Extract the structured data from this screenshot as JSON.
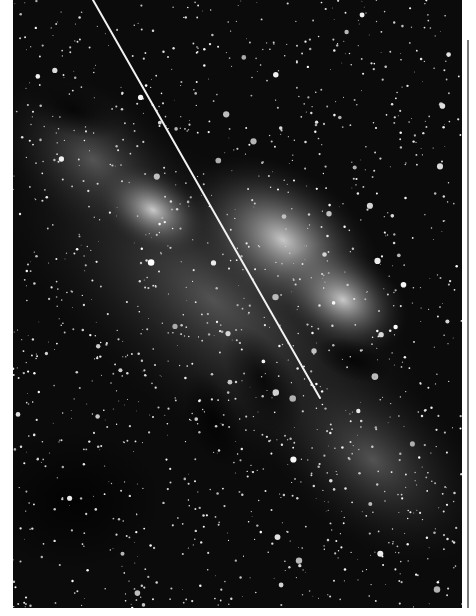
{
  "image": {
    "subject": "Milky Way star field with a bright diagonal satellite/meteor trail",
    "kind": "black-and-white astronomical photograph",
    "features": [
      "dense star field",
      "bright galactic core band",
      "dark dust lanes",
      "diagonal light trail"
    ],
    "colors": {
      "sky": "#0a0a0a",
      "glow": "#e8e8e8",
      "trail": "#f2f2f2",
      "rule": "#7a7a7a",
      "page": "#ffffff"
    }
  }
}
